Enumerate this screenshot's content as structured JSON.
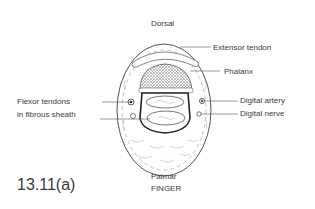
{
  "diagram": {
    "orientation_top": "Dorsal",
    "orientation_bottom": "Palmar",
    "subject": "FINGER",
    "figure_number": "13.11(a)",
    "labels": {
      "extensor_tendon": "Extensor tendon",
      "phalanx": "Phalanx",
      "flexor_tendons_line1": "Flexor tendons",
      "flexor_tendons_line2": "in fibrous sheath",
      "digital_artery": "Digital artery",
      "digital_nerve": "Digital nerve"
    }
  }
}
